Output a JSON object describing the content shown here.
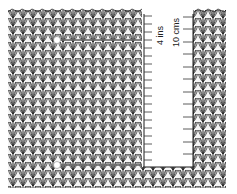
{
  "figure": {
    "colors": {
      "background": "#ffffff",
      "stitch_outline": "#1a1a1a",
      "stitch_fill": "#f4f4f4",
      "measure_line": "#555555",
      "pin": "#ffffff"
    }
  },
  "rulers": [
    {
      "id": "inch-ruler",
      "label": "4 ins",
      "units": "inches",
      "length": 4,
      "tick_style": "quarter-inch"
    },
    {
      "id": "cm-ruler",
      "label": "10 cms",
      "units": "centimetres",
      "length": 10,
      "tick_style": "centimetre"
    }
  ],
  "markers": [
    {
      "id": "top-pin",
      "type": "pin",
      "position": "top-row"
    },
    {
      "id": "bottom-pin",
      "type": "pin",
      "position": "bottom-row"
    }
  ]
}
